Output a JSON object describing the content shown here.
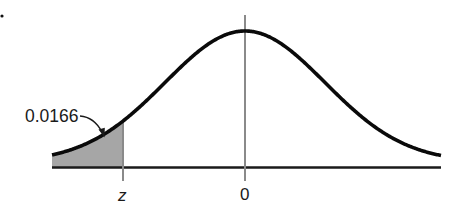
{
  "chart_data": {
    "type": "area",
    "title": "",
    "xlabel": "",
    "ylabel": "",
    "x_tick_labels": [
      "z",
      "0"
    ],
    "shaded_region": {
      "side": "left",
      "from": "-inf",
      "to": "z",
      "area": 0.0166
    },
    "annotations": [
      {
        "text": "0.0166",
        "points_to": "shaded left-tail area"
      }
    ],
    "z_value_approx": -2.13,
    "grid": false,
    "legend": null
  },
  "labels": {
    "area_label": "0.0166",
    "z_tick": "z",
    "zero_tick": "0"
  },
  "colors": {
    "curve": "#0a0a0a",
    "axis": "#1a1a1a",
    "shade": "#a6a6a6",
    "marker_lines": "#8a8a8a"
  }
}
